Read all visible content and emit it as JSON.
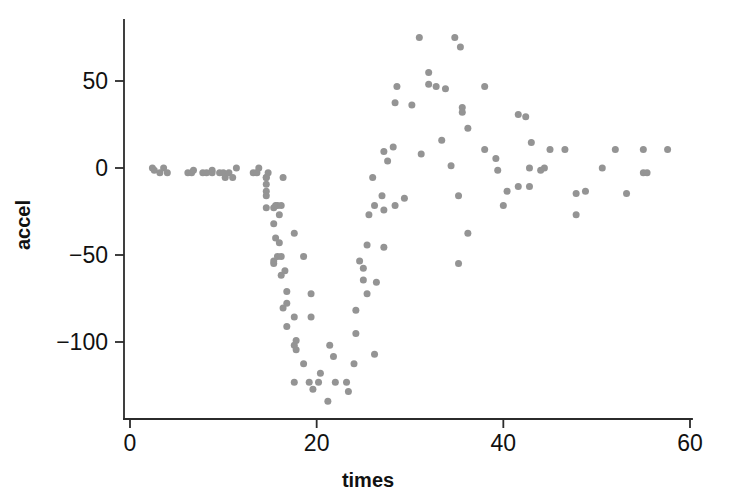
{
  "chart_data": {
    "type": "scatter",
    "title": "",
    "xlabel": "times",
    "ylabel": "accel",
    "xlim": [
      0,
      60
    ],
    "ylim": [
      -140,
      85
    ],
    "xticks": [
      0,
      20,
      40,
      60
    ],
    "yticks": [
      50,
      0,
      -50,
      -100
    ],
    "xtick_labels": [
      "0",
      "20",
      "40",
      "60"
    ],
    "ytick_labels": [
      "50",
      "0",
      "-50",
      "-100"
    ],
    "grid": false,
    "legend": null,
    "marker": "filled-circle",
    "marker_color": "#949494",
    "marker_size": 7,
    "axis_color": "#2b2b2b",
    "background_color": "#ffffff",
    "n_points": 133,
    "x": [
      2.4,
      2.6,
      3.2,
      3.6,
      4.0,
      6.2,
      6.6,
      6.8,
      7.8,
      8.2,
      8.8,
      8.8,
      9.6,
      10.0,
      10.2,
      10.6,
      11.0,
      11.4,
      13.2,
      13.6,
      13.8,
      14.6,
      14.6,
      14.6,
      14.6,
      14.6,
      14.6,
      14.8,
      15.4,
      15.4,
      15.4,
      15.4,
      15.6,
      15.6,
      15.8,
      15.8,
      16.0,
      16.0,
      16.2,
      16.2,
      16.2,
      16.4,
      16.4,
      16.6,
      16.8,
      16.8,
      16.8,
      17.6,
      17.6,
      17.6,
      17.6,
      17.8,
      17.8,
      18.6,
      18.6,
      19.2,
      19.4,
      19.4,
      19.6,
      20.2,
      20.4,
      21.2,
      21.4,
      21.8,
      22.0,
      23.2,
      23.4,
      24.0,
      24.2,
      24.2,
      24.6,
      25.0,
      25.0,
      25.4,
      25.4,
      25.6,
      26.0,
      26.2,
      26.2,
      26.4,
      27.0,
      27.2,
      27.2,
      27.2,
      27.6,
      28.2,
      28.4,
      28.4,
      28.6,
      29.4,
      30.2,
      31.0,
      31.2,
      32.0,
      32.0,
      32.8,
      33.4,
      33.8,
      34.4,
      34.8,
      35.2,
      35.2,
      35.4,
      35.6,
      35.6,
      36.2,
      36.2,
      38.0,
      38.0,
      39.2,
      39.4,
      40.0,
      40.4,
      41.6,
      41.6,
      42.4,
      42.8,
      42.8,
      43.0,
      44.0,
      44.4,
      45.0,
      46.6,
      47.8,
      47.8,
      48.8,
      50.6,
      52.0,
      53.2,
      55.0,
      55.0,
      55.4,
      57.6
    ],
    "y": [
      0.0,
      -1.3,
      -2.7,
      0.0,
      -2.7,
      -2.7,
      -2.7,
      -1.3,
      -2.7,
      -2.7,
      -1.3,
      -2.7,
      -2.7,
      -2.7,
      -5.4,
      -2.7,
      -5.4,
      0.0,
      -2.7,
      -2.7,
      0.0,
      -13.3,
      -5.4,
      -5.4,
      -9.3,
      -16.0,
      -22.8,
      -2.7,
      -22.8,
      -32.1,
      -53.5,
      -54.9,
      -40.2,
      -21.5,
      -21.5,
      -50.8,
      -42.9,
      -26.8,
      -21.5,
      -50.8,
      -61.7,
      -5.4,
      -80.4,
      -59.0,
      -71.0,
      -91.1,
      -77.7,
      -37.5,
      -85.6,
      -123.1,
      -101.9,
      -99.1,
      -104.4,
      -112.5,
      -50.8,
      -123.1,
      -85.6,
      -72.3,
      -127.2,
      -123.1,
      -117.9,
      -134.0,
      -101.9,
      -108.4,
      -123.1,
      -123.1,
      -128.5,
      -112.5,
      -95.1,
      -81.8,
      -53.5,
      -64.4,
      -57.6,
      -72.3,
      -44.3,
      -26.8,
      -5.4,
      -107.1,
      -21.5,
      -65.6,
      -16.0,
      -45.6,
      -24.2,
      9.5,
      4.0,
      12.0,
      -21.5,
      37.5,
      46.9,
      -17.4,
      36.2,
      75.0,
      8.1,
      54.9,
      48.2,
      46.9,
      16.0,
      45.6,
      1.3,
      75.0,
      -16.0,
      -54.9,
      69.6,
      34.8,
      32.1,
      -37.5,
      22.8,
      46.9,
      10.7,
      5.4,
      -1.3,
      -21.5,
      -13.3,
      30.8,
      -10.7,
      29.4,
      0.0,
      -10.7,
      14.7,
      -1.3,
      0.0,
      10.7,
      10.7,
      -26.8,
      -14.7,
      -13.3,
      0.0,
      10.7,
      -14.7,
      -2.7,
      10.7,
      -2.7,
      10.7
    ]
  }
}
